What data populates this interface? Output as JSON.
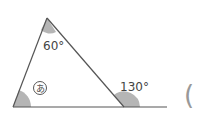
{
  "figure": {
    "type": "triangle-exterior-angle",
    "angles": {
      "top": "60°",
      "unknown": "あ",
      "exterior": "130°"
    },
    "answer_paren": "("
  },
  "colors": {
    "line": "#555555",
    "fill": "#b5b5b5",
    "text": "#444444"
  }
}
